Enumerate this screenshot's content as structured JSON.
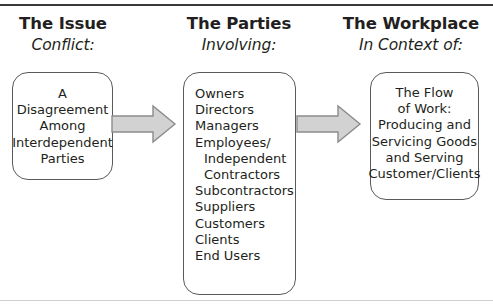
{
  "figure": {
    "rule_top": "horizontal-rule",
    "rule_bottom": "horizontal-rule"
  },
  "columns": [
    {
      "heading": "The Issue",
      "subheading": "Conflict:",
      "box_lines": [
        "A",
        "Disagreement",
        "Among",
        "Interdependent",
        "Parties"
      ]
    },
    {
      "heading": "The Parties",
      "subheading": "Involving:",
      "box_lines": [
        "Owners",
        "Directors",
        "Managers",
        "Employees/",
        "Independent",
        "Contractors",
        "Subcontractors",
        "Suppliers",
        "Customers",
        "Clients",
        "End Users"
      ]
    },
    {
      "heading": "The Workplace",
      "subheading": "In Context of:",
      "box_lines": [
        "The Flow",
        "of Work:",
        "Producing and",
        "Servicing Goods",
        "and Serving",
        "Customer/Clients"
      ]
    }
  ],
  "arrows": [
    {
      "name": "arrow-issue-to-parties",
      "direction": "right"
    },
    {
      "name": "arrow-parties-to-workplace",
      "direction": "right"
    }
  ],
  "colors": {
    "text": "#231f20",
    "box_border": "#5a5a5a",
    "arrow_fill": "#d2d2d2",
    "arrow_stroke": "#8c8c8c",
    "rule_top": "#3a3a3a",
    "rule_bottom": "#cfcfcf",
    "background": "#ffffff"
  }
}
